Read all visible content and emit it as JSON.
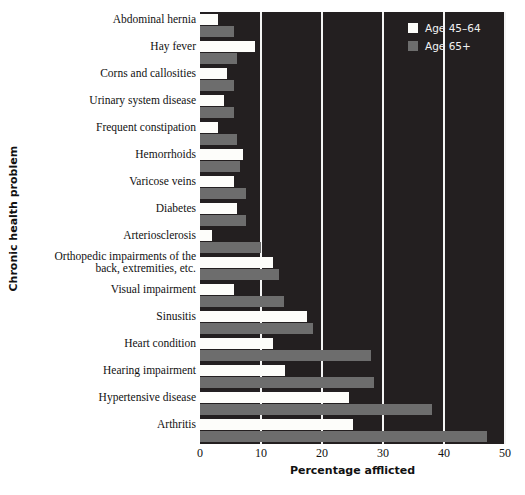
{
  "chart_data": {
    "type": "bar",
    "orientation": "horizontal",
    "title": "",
    "xlabel": "Percentage afflicted",
    "ylabel": "Chronic health problem",
    "xlim": [
      0,
      50
    ],
    "xticks": [
      0,
      10,
      20,
      30,
      40,
      50
    ],
    "grid": true,
    "legend_position": "top-right",
    "background": "#231f20",
    "categories": [
      "Abdominal hernia",
      "Hay fever",
      "Corns and callosities",
      "Urinary system disease",
      "Frequent constipation",
      "Hemorrhoids",
      "Varicose veins",
      "Diabetes",
      "Arteriosclerosis",
      "Orthopedic impairments of the back, extremities, etc.",
      "Visual impairment",
      "Sinusitis",
      "Heart condition",
      "Hearing impairment",
      "Hypertensive disease",
      "Arthritis"
    ],
    "series": [
      {
        "name": "Age 45–64",
        "color": "#fdfdfa",
        "values": [
          3.0,
          9.0,
          4.5,
          4.0,
          3.0,
          7.0,
          5.5,
          6.0,
          2.0,
          12.0,
          5.5,
          17.5,
          12.0,
          14.0,
          24.5,
          25.0
        ]
      },
      {
        "name": "Age 65+",
        "color": "#6d6d6d",
        "values": [
          5.5,
          6.0,
          5.5,
          5.5,
          6.0,
          6.5,
          7.5,
          7.5,
          10.0,
          13.0,
          13.8,
          18.5,
          28.0,
          28.5,
          38.0,
          47.0
        ]
      }
    ]
  },
  "labels": {
    "category_display": [
      [
        "Abdominal hernia"
      ],
      [
        "Hay fever"
      ],
      [
        "Corns and callosities"
      ],
      [
        "Urinary system disease"
      ],
      [
        "Frequent constipation"
      ],
      [
        "Hemorrhoids"
      ],
      [
        "Varicose veins"
      ],
      [
        "Diabetes"
      ],
      [
        "Arteriosclerosis"
      ],
      [
        "Orthopedic impairments of the",
        "back, extremities, etc."
      ],
      [
        "Visual impairment"
      ],
      [
        "Sinusitis"
      ],
      [
        "Heart condition"
      ],
      [
        "Hearing impairment"
      ],
      [
        "Hypertensive disease"
      ],
      [
        "Arthritis"
      ]
    ]
  },
  "caption": {
    "text": ""
  }
}
